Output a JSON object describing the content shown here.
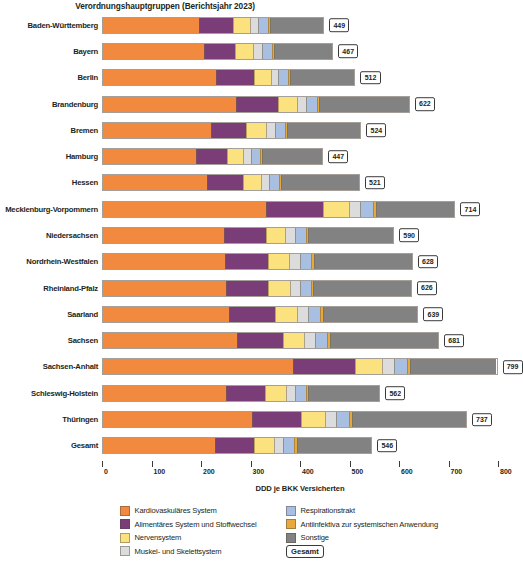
{
  "chart_data": {
    "type": "bar",
    "orientation": "horizontal",
    "stacked": true,
    "title": "Verordnungshauptgruppen (Berichtsjahr 2023)",
    "xlabel": "DDD je BKK Versicherten",
    "ylabel": "",
    "xlim": [
      0,
      800
    ],
    "xticks": [
      0,
      100,
      200,
      300,
      400,
      500,
      600,
      700,
      800
    ],
    "xtick_labels": [
      "0",
      "100",
      "200",
      "300",
      "400",
      "500",
      "600",
      "700",
      "800"
    ],
    "grid": false,
    "legend_position": "bottom",
    "categories": [
      "Baden-Württemberg",
      "Bayern",
      "Berlin",
      "Brandenburg",
      "Bremen",
      "Hamburg",
      "Hessen",
      "Mecklenburg-Vorpommern",
      "Niedersachsen",
      "Nordrhein-Westfalen",
      "Rheinland-Pfalz",
      "Saarland",
      "Sachsen",
      "Sachsen-Anhalt",
      "Schleswig-Holstein",
      "Thüringen",
      "Gesamt"
    ],
    "series": [
      {
        "name": "Kardiovaskuläres System",
        "color": "#F18A3F",
        "values": [
          196,
          205,
          231,
          270,
          220,
          190,
          211,
          331,
          247,
          249,
          250,
          257,
          273,
          386,
          250,
          302,
          228
        ]
      },
      {
        "name": "Alimentäres System und Stoffwechsel",
        "color": "#7B3D78",
        "values": [
          69,
          65,
          76,
          86,
          72,
          62,
          74,
          117,
          84,
          87,
          86,
          92,
          92,
          125,
          80,
          100,
          80
        ]
      },
      {
        "name": "Nervensystem",
        "color": "#FBE27E",
        "values": [
          35,
          36,
          35,
          39,
          40,
          34,
          37,
          52,
          40,
          43,
          44,
          46,
          44,
          55,
          42,
          50,
          40
        ]
      },
      {
        "name": "Muskel- und Skelettsystem",
        "color": "#DCDCDC",
        "values": [
          17,
          19,
          15,
          18,
          18,
          16,
          17,
          22,
          19,
          21,
          20,
          22,
          22,
          24,
          19,
          22,
          19
        ]
      },
      {
        "name": "Respirationstrakt",
        "color": "#A9BFE1",
        "values": [
          19,
          19,
          20,
          22,
          20,
          19,
          20,
          27,
          22,
          24,
          23,
          25,
          25,
          28,
          22,
          26,
          22
        ]
      },
      {
        "name": "Antiinfektiva zur systemischen Anwendung",
        "color": "#E8A93C",
        "values": [
          4,
          4,
          4,
          5,
          4,
          4,
          4,
          5,
          5,
          5,
          5,
          5,
          5,
          6,
          4,
          5,
          5
        ]
      },
      {
        "name": "Sonstige",
        "color": "#828282",
        "values": [
          109,
          119,
          131,
          182,
          150,
          122,
          158,
          160,
          173,
          199,
          198,
          192,
          220,
          175,
          145,
          232,
          152
        ]
      }
    ],
    "totals": [
      449,
      467,
      512,
      622,
      524,
      447,
      521,
      714,
      590,
      628,
      626,
      639,
      681,
      799,
      562,
      737,
      546
    ],
    "totals_legend_label": "Gesamt"
  }
}
